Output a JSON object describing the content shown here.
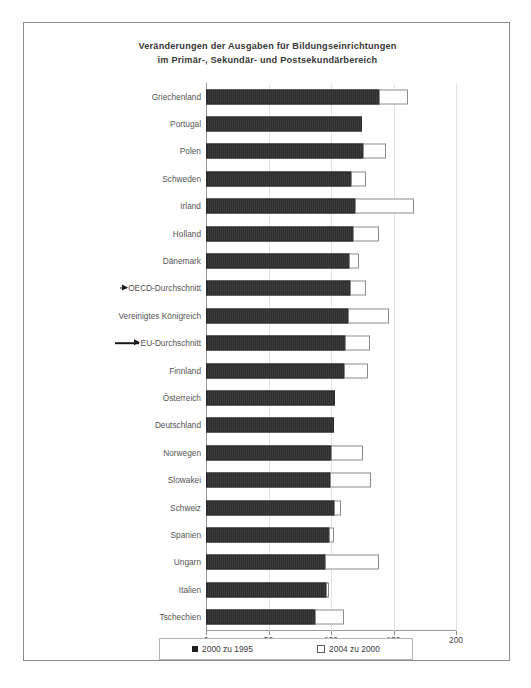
{
  "chart_data": {
    "type": "bar",
    "orientation": "horizontal",
    "stacked": true,
    "title": "Veränderungen der Ausgaben für Bildungseinrichtungen im Primär-, Sekundär- und Postsekundärbereich",
    "title_line1": "Veränderungen der Ausgaben für Bildungseinrichtungen",
    "title_line2": "im Primär-, Sekundär- und Postsekundärbereich",
    "xlabel": "",
    "ylabel": "",
    "xlim": [
      0,
      200
    ],
    "xticks": [
      "0",
      "50",
      "100",
      "150",
      "200"
    ],
    "xtick_values": [
      0,
      50,
      100,
      150,
      200
    ],
    "grid": true,
    "legend_position": "bottom",
    "categories": [
      "Griechenland",
      "Portugal",
      "Polen",
      "Schweden",
      "Irland",
      "Holland",
      "Dänemark",
      "OECD-Durchschnitt",
      "Vereinigtes Königreich",
      "EU-Durchschnitt",
      "Finnland",
      "Österreich",
      "Deutschland",
      "Norwegen",
      "Slowakei",
      "Schweiz",
      "Spanien",
      "Ungarn",
      "Italien",
      "Tschechien"
    ],
    "series": [
      {
        "name": "2000 zu 1995",
        "style": "filled-dark",
        "values": [
          139,
          125,
          126,
          117,
          120,
          118,
          115,
          116,
          114,
          112,
          111,
          103,
          102,
          101,
          100,
          103,
          99,
          96,
          97,
          88
        ]
      },
      {
        "name": "2004 zu 2000",
        "style": "outlined-white",
        "values": [
          23,
          0,
          19,
          12,
          47,
          21,
          8,
          13,
          33,
          20,
          19,
          0,
          0,
          25,
          33,
          6,
          4,
          43,
          2,
          23
        ]
      }
    ],
    "totals": [
      162,
      125,
      145,
      129,
      167,
      139,
      123,
      129,
      147,
      132,
      130,
      103,
      102,
      126,
      133,
      109,
      103,
      139,
      99,
      111
    ],
    "annotations": [
      {
        "target": "OECD-Durchschnitt",
        "marker": "arrow",
        "size": "short"
      },
      {
        "target": "EU-Durchschnitt",
        "marker": "arrow",
        "size": "long"
      }
    ]
  },
  "legend": {
    "items": [
      {
        "label": "2000 zu 1995",
        "swatch": "dark"
      },
      {
        "label": "2004 zu 2000",
        "swatch": "light"
      }
    ]
  }
}
